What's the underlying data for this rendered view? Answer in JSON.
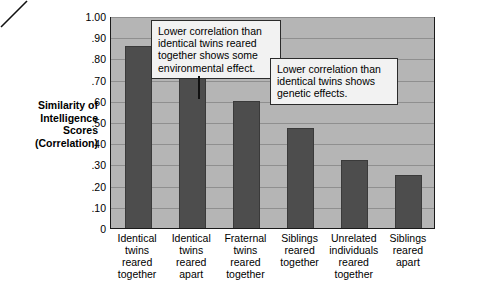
{
  "chart_data": {
    "type": "bar",
    "title": "",
    "xlabel": "",
    "ylabel": "Similarity of Intelligence Scores (Correlation)",
    "ylim": [
      0,
      1.0
    ],
    "grid": true,
    "legend": "none",
    "categories": [
      "Identical twins reared together",
      "Identical twins reared apart",
      "Fraternal twins reared together",
      "Siblings reared together",
      "Unrelated individuals reared together",
      "Siblings reared apart"
    ],
    "category_lines": [
      [
        "Identical",
        "twins",
        "reared",
        "together"
      ],
      [
        "Identical",
        "twins",
        "reared",
        "apart"
      ],
      [
        "Fraternal",
        "twins",
        "reared",
        "together"
      ],
      [
        "Siblings",
        "reared",
        "together"
      ],
      [
        "Unrelated",
        "individuals",
        "reared",
        "together"
      ],
      [
        "Siblings",
        "reared",
        "apart"
      ]
    ],
    "values": [
      0.86,
      0.73,
      0.6,
      0.47,
      0.32,
      0.25
    ],
    "ytick_labels": [
      "1.00",
      ".90",
      ".80",
      ".70",
      ".60",
      ".50",
      ".40",
      ".30",
      ".20",
      ".10",
      "0"
    ],
    "ytick_values": [
      1.0,
      0.9,
      0.8,
      0.7,
      0.6,
      0.5,
      0.4,
      0.3,
      0.2,
      0.1,
      0.0
    ],
    "annotations": [
      {
        "id": "environmental",
        "text": "Lower correlation than identical twins reared together shows some environmental effect.",
        "points_to_category": "Identical twins reared apart"
      },
      {
        "id": "genetic",
        "text": "Lower correlation than identical twins shows genetic effects.",
        "points_to_category": "Fraternal twins reared together"
      }
    ],
    "colors": {
      "bar": "#4d4d4d",
      "plot_background": "#b5b5b5",
      "gridline": "#8f8f8f",
      "frame": "#1a1a1a",
      "callout_background": "#f2f2f2",
      "text": "#000000"
    }
  },
  "axis": {
    "y_title_lines": [
      "Similarity of",
      "Intelligence",
      "Scores",
      "(Correlation)"
    ]
  }
}
